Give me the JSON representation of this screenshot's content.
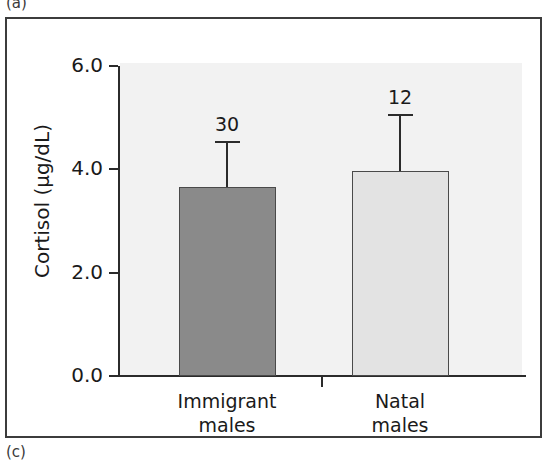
{
  "figure": {
    "panel_letter_top": "(a)",
    "panel_letter_bottom": "(c)"
  },
  "colors": {
    "bar_immigrant_fill": "#8a8a8a",
    "bar_natal_fill": "#e3e3e3",
    "bar_edge": "#4a4a4a",
    "axis": "#2b2b2b",
    "plot_background": "#f2f2f2",
    "frame": "#3c3c3c"
  },
  "chart_data": {
    "type": "bar",
    "title": "",
    "xlabel": "",
    "ylabel": "Cortisol (µg/dL)",
    "categories": [
      "Immigrant males",
      "Natal males"
    ],
    "category_lines": [
      [
        "Immigrant",
        "males"
      ],
      [
        "Natal",
        "males"
      ]
    ],
    "values": [
      3.65,
      3.96
    ],
    "errors_upper": [
      0.9,
      1.12
    ],
    "error_tops": [
      4.55,
      5.08
    ],
    "sample_size_labels": [
      "30",
      "12"
    ],
    "sample_sizes": [
      30,
      12
    ],
    "bar_colors": [
      "#8a8a8a",
      "#e3e3e3"
    ],
    "ylim": [
      0.0,
      6.0
    ],
    "yticks": [
      "0.0",
      "2.0",
      "4.0",
      "6.0"
    ],
    "ytick_values": [
      0.0,
      2.0,
      4.0,
      6.0
    ],
    "grid": false,
    "legend": "none"
  }
}
